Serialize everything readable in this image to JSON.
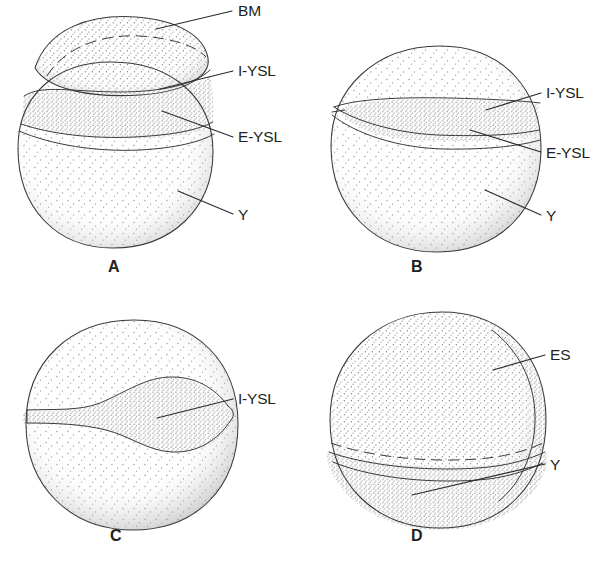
{
  "figure": {
    "kind": "scientific-line-drawing",
    "background_color": "#ffffff",
    "ink_color": "#231f20",
    "stipple_color": "#8d8d8d",
    "panels": [
      {
        "id": "A",
        "letter": "A",
        "description": "Blastoderm cap sits as a lens-shaped dome on top of the yolk; dashed blastoderm margin arc inside the cap; I-YSL band below the cap; E-YSL boundary below that; large stippled yolk beneath.",
        "labels": [
          {
            "key": "BM",
            "text": "BM",
            "meaning": "blastoderm margin"
          },
          {
            "key": "I-YSL",
            "text": "I-YSL",
            "meaning": "internal yolk syncytial layer"
          },
          {
            "key": "E-YSL",
            "text": "E-YSL",
            "meaning": "external yolk syncytial layer"
          },
          {
            "key": "Y",
            "text": "Y",
            "meaning": "yolk"
          }
        ]
      },
      {
        "id": "B",
        "letter": "B",
        "description": "Blastoderm has spread further; a narrow tapered lens-shaped I-YSL band crosses the middle of the egg, with E-YSL just below it and the yolk mass below.",
        "labels": [
          {
            "key": "I-YSL",
            "text": "I-YSL",
            "meaning": "internal yolk syncytial layer"
          },
          {
            "key": "E-YSL",
            "text": "E-YSL",
            "meaning": "external yolk syncytial layer"
          },
          {
            "key": "Y",
            "text": "Y",
            "meaning": "yolk"
          }
        ]
      },
      {
        "id": "C",
        "letter": "C",
        "description": "Mid-epiboly; the I-YSL appears as a thick S-curved lens bulging downward across the equator of the egg.",
        "labels": [
          {
            "key": "I-YSL",
            "text": "I-YSL",
            "meaning": "internal yolk syncytial layer"
          }
        ]
      },
      {
        "id": "D",
        "letter": "D",
        "description": "Late epiboly; blastoderm covers most of the egg, a crescent embryonic shield thickening appears on the right margin, dashed margin arc near the bottom, remaining yolk plug below.",
        "labels": [
          {
            "key": "ES",
            "text": "ES",
            "meaning": "embryonic shield"
          },
          {
            "key": "Y",
            "text": "Y",
            "meaning": "yolk"
          }
        ]
      }
    ]
  },
  "panel_a": {
    "letter": "A",
    "label_bm": "BM",
    "label_iysl": "I-YSL",
    "label_eysl": "E-YSL",
    "label_y": "Y"
  },
  "panel_b": {
    "letter": "B",
    "label_iysl": "I-YSL",
    "label_eysl": "E-YSL",
    "label_y": "Y"
  },
  "panel_c": {
    "letter": "C",
    "label_iysl": "I-YSL"
  },
  "panel_d": {
    "letter": "D",
    "label_es": "ES",
    "label_y": "Y"
  }
}
